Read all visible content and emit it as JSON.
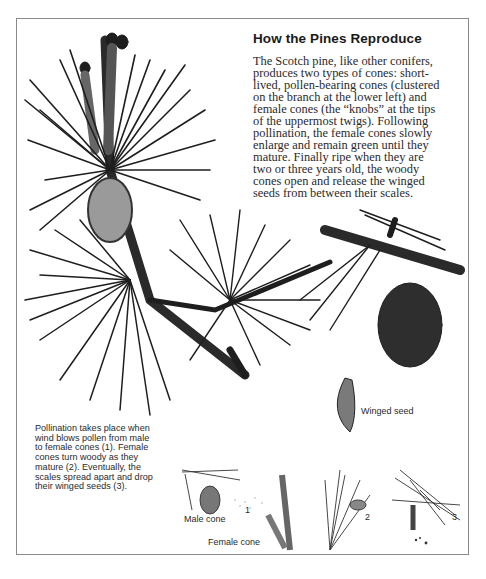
{
  "heading": "How the Pines Reproduce",
  "body_lines": [
    "The Scotch pine, like other conifers,",
    "produces two types of cones: short-",
    "lived, pollen-bearing cones (clustered",
    "on the branch at the lower left) and",
    "female cones (the “knobs” at the tips",
    "of the uppermost twigs). Following",
    "pollination, the female cones slowly",
    "enlarge and remain green until they",
    "mature. Finally ripe when they are",
    "two or three years old, the woody",
    "cones open and release the winged",
    "seeds from between their scales."
  ],
  "caption_lines": [
    "Pollination takes place when",
    "wind blows pollen from male",
    "to female cones (1). Female",
    "cones turn woody as they",
    "mature (2). Eventually, the",
    "scales spread apart and drop",
    "their winged seeds (3)."
  ],
  "labels": {
    "winged_seed": "Winged seed",
    "male_cone": "Male cone",
    "female_cone": "Female cone",
    "stage_1": "1",
    "stage_2": "2",
    "stage_3": "3"
  },
  "illustration": {
    "subject": "Scotch pine branch with cones",
    "ink_color": "#1e1e1e",
    "frame_color": "#8a8a8a"
  }
}
